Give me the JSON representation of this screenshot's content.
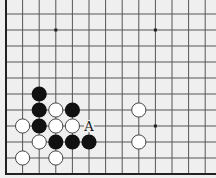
{
  "diagram": {
    "type": "go-board-fragment",
    "colors": {
      "board": "#efefef",
      "line": "#555555",
      "edge": "#222222",
      "black_stone": "#111111",
      "white_stone": "#ffffff",
      "white_stroke": "#333333"
    },
    "grid": {
      "origin_x": 6,
      "origin_y": 14,
      "spacing_x": 16.6,
      "spacing_y": 16.0,
      "cols": 13,
      "rows": 10,
      "left_edge": true,
      "bottom_edge": true,
      "bottom_edge_y": 174
    },
    "star_points": [
      {
        "col": 3,
        "row": 1
      },
      {
        "col": 9,
        "row": 1
      },
      {
        "col": 9,
        "row": 7
      }
    ],
    "stones": [
      {
        "color": "black",
        "col": 2,
        "row": 5
      },
      {
        "color": "black",
        "col": 2,
        "row": 6
      },
      {
        "color": "white",
        "col": 3,
        "row": 6
      },
      {
        "color": "black",
        "col": 4,
        "row": 6
      },
      {
        "color": "white",
        "col": 1,
        "row": 7
      },
      {
        "color": "black",
        "col": 2,
        "row": 7
      },
      {
        "color": "white",
        "col": 3,
        "row": 7
      },
      {
        "color": "white",
        "col": 4,
        "row": 7
      },
      {
        "color": "white",
        "col": 2,
        "row": 8
      },
      {
        "color": "black",
        "col": 3,
        "row": 8
      },
      {
        "color": "black",
        "col": 4,
        "row": 8
      },
      {
        "color": "black",
        "col": 5,
        "row": 8
      },
      {
        "color": "white",
        "col": 1,
        "row": 9
      },
      {
        "color": "white",
        "col": 3,
        "row": 9
      },
      {
        "color": "white",
        "col": 8,
        "row": 6
      },
      {
        "color": "white",
        "col": 8,
        "row": 8
      }
    ],
    "labels": [
      {
        "text": "A",
        "col": 5,
        "row": 7
      }
    ]
  }
}
